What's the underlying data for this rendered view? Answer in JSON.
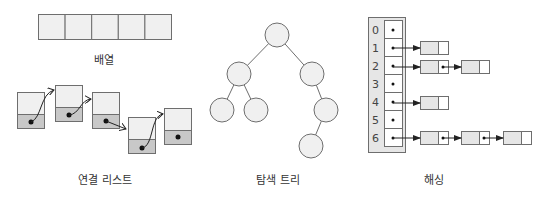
{
  "colors": {
    "stroke": "#6e6e6e",
    "fill_light": "#f0f0f0",
    "fill_dark": "#c8c8c8",
    "arrow": "#222222",
    "text": "#333333"
  },
  "array": {
    "label": "배열",
    "cells": 5
  },
  "linked_list": {
    "label": "연결 리스트",
    "nodes": 5
  },
  "tree": {
    "label": "탐색 트리",
    "nodes": 7
  },
  "hashing": {
    "label": "해싱",
    "indices": [
      "0",
      "1",
      "2",
      "3",
      "4",
      "5",
      "6"
    ],
    "chain_lengths": [
      0,
      1,
      2,
      0,
      1,
      0,
      3
    ]
  }
}
